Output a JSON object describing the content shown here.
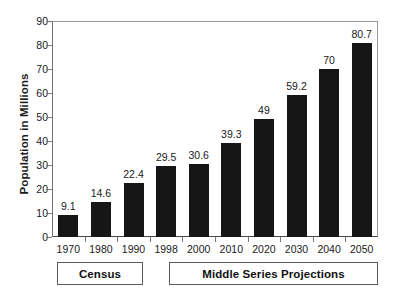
{
  "chart_data": {
    "type": "bar",
    "title": "",
    "xlabel": "",
    "ylabel": "Population in Millions",
    "categories": [
      "1970",
      "1980",
      "1990",
      "1998",
      "2000",
      "2010",
      "2020",
      "2030",
      "2040",
      "2050"
    ],
    "values": [
      9.1,
      14.6,
      22.4,
      29.5,
      30.6,
      39.3,
      49,
      59.2,
      70,
      80.7
    ],
    "value_labels": [
      "9.1",
      "14.6",
      "22.4",
      "29.5",
      "30.6",
      "39.3",
      "49",
      "59.2",
      "70",
      "80.7"
    ],
    "ylim": [
      0,
      90
    ],
    "ytick_values": [
      0,
      10,
      20,
      30,
      40,
      50,
      60,
      70,
      80,
      90
    ],
    "ytick_labels": [
      "0",
      "10",
      "20",
      "30",
      "40",
      "50",
      "60",
      "70",
      "80",
      "90"
    ],
    "grid": false,
    "legend": "none",
    "bar_color": "#161616",
    "background_color": "#ffffff",
    "axis_color": "#5a5a5a",
    "groups": [
      {
        "label": "Census",
        "categories": [
          "1970",
          "1980",
          "1990"
        ]
      },
      {
        "label": "Middle Series Projections",
        "categories": [
          "1998",
          "2000",
          "2010",
          "2020",
          "2030",
          "2040",
          "2050"
        ]
      }
    ]
  },
  "axes": {
    "y_title": "Population in Millions"
  },
  "groups": {
    "census_label": "Census",
    "projections_label": "Middle Series Projections"
  }
}
